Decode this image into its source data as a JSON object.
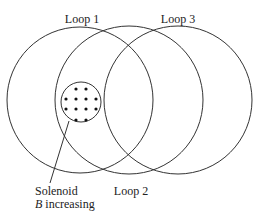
{
  "diagram": {
    "loops": [
      {
        "id": "loop1",
        "label": "Loop 1",
        "cx": 80,
        "cy": 100,
        "r": 73,
        "label_x": 82,
        "label_y": 23
      },
      {
        "id": "loop2",
        "label": "Loop 2",
        "cx": 129,
        "cy": 100,
        "r": 74,
        "label_x": 131,
        "label_y": 195
      },
      {
        "id": "loop3",
        "label": "Loop 3",
        "cx": 178,
        "cy": 100,
        "r": 74,
        "label_x": 178,
        "label_y": 23
      }
    ],
    "solenoid": {
      "label": "Solenoid",
      "field_symbol": "B",
      "field_text": " increasing",
      "cx": 81,
      "cy": 102,
      "r": 20,
      "field_direction": "out of page (dots)",
      "dots": [
        [
          76,
          89
        ],
        [
          86,
          89
        ],
        [
          66,
          99
        ],
        [
          76,
          99
        ],
        [
          86,
          99
        ],
        [
          96,
          99
        ],
        [
          66,
          109
        ],
        [
          76,
          109
        ],
        [
          86,
          109
        ],
        [
          96,
          109
        ],
        [
          76,
          120
        ],
        [
          86,
          120
        ]
      ],
      "leader": {
        "x1": 69,
        "y1": 121,
        "x2": 50,
        "y2": 183
      }
    },
    "stroke_color": "#333333"
  }
}
